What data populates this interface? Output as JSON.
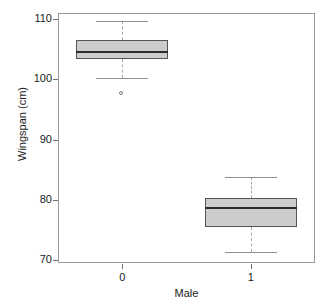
{
  "chart_data": {
    "type": "box",
    "title": "",
    "xlabel": "Male",
    "ylabel": "Wingspan (cm)",
    "categories": [
      "0",
      "1"
    ],
    "yticks": [
      70,
      80,
      90,
      100,
      110
    ],
    "ytick_labels": [
      "70",
      "80",
      "90",
      "100",
      "110"
    ],
    "ylim": [
      69.5,
      111.0
    ],
    "grid": false,
    "legend": null,
    "box_fill_color": "#cccccc",
    "box_edge_color": "#555555",
    "median_color": "#2b2b2b",
    "whisker_color": "#a8a8a8",
    "frame_color": "#9a9a9a",
    "boxes": [
      {
        "category": "0",
        "whisker_low": 100.2,
        "q1": 103.3,
        "median": 104.5,
        "q3": 106.5,
        "whisker_high": 109.7,
        "outliers": [
          97.5
        ]
      },
      {
        "category": "1",
        "whisker_low": 71.3,
        "q1": 75.5,
        "median": 78.6,
        "q3": 80.3,
        "whisker_high": 83.8,
        "outliers": []
      }
    ]
  },
  "axes": {
    "y_title": "Wingspan (cm)",
    "x_title": "Male"
  }
}
